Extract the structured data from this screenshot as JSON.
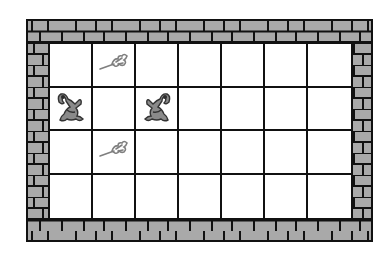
{
  "board": {
    "columns": 7,
    "rows": 4,
    "colors": {
      "wall_fill": "#a9a9a9",
      "wall_mortar": "#111111",
      "cell_bg": "#ffffff",
      "piece_gray": "#7f7f7f"
    },
    "pieces": [
      {
        "type": "flower",
        "row": 0,
        "col": 1
      },
      {
        "type": "frog",
        "row": 1,
        "col": 0,
        "facing": "right"
      },
      {
        "type": "frog",
        "row": 1,
        "col": 2,
        "facing": "left"
      },
      {
        "type": "flower",
        "row": 2,
        "col": 1
      }
    ]
  }
}
